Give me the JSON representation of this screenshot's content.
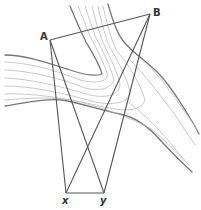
{
  "diagram": {
    "type": "geometry-river-triangulation",
    "points": {
      "A": {
        "label": "A",
        "x": 50,
        "y": 40
      },
      "B": {
        "label": "B",
        "x": 150,
        "y": 14
      },
      "x": {
        "label": "x",
        "x": 66,
        "y": 193
      },
      "y": {
        "label": "y",
        "x": 104,
        "y": 193
      }
    },
    "segments": [
      "A-B",
      "A-x",
      "A-y",
      "B-x",
      "B-y",
      "x-y"
    ],
    "colors": {
      "line": "#555555",
      "river_edge": "#777777",
      "river_flow": "#bbbbbb"
    }
  }
}
